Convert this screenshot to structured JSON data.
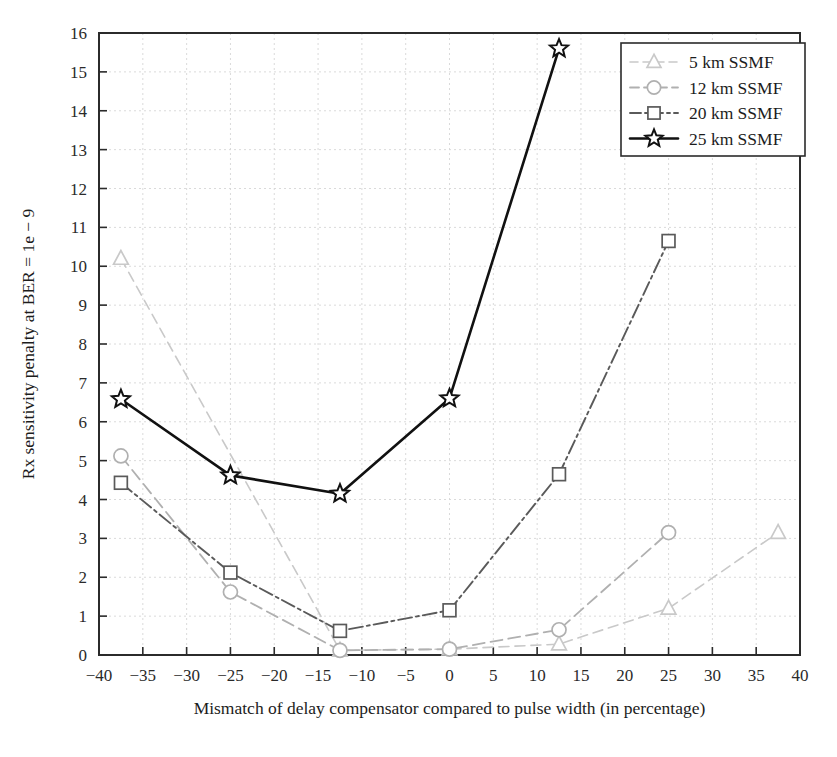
{
  "chart_data": {
    "type": "line",
    "title": "",
    "xlabel": "Mismatch of delay compensator compared to pulse width (in percentage)",
    "ylabel": "Rx sensitivity penalty at BER = 1e − 9",
    "xlim": [
      -40,
      40
    ],
    "ylim": [
      0,
      16
    ],
    "xticks": [
      -40,
      -35,
      -30,
      -25,
      -20,
      -15,
      -10,
      -5,
      0,
      5,
      10,
      15,
      20,
      25,
      30,
      35,
      40
    ],
    "yticks": [
      0,
      1,
      2,
      3,
      4,
      5,
      6,
      7,
      8,
      9,
      10,
      11,
      12,
      13,
      14,
      15,
      16
    ],
    "xtick_labels": [
      "−40",
      "−35",
      "−30",
      "−25",
      "−20",
      "−15",
      "−10",
      "−5",
      "0",
      "5",
      "10",
      "15",
      "20",
      "25",
      "30",
      "35",
      "40"
    ],
    "ytick_labels": [
      "0",
      "1",
      "2",
      "3",
      "4",
      "5",
      "6",
      "7",
      "8",
      "9",
      "10",
      "11",
      "12",
      "13",
      "14",
      "15",
      "16"
    ],
    "grid": true,
    "grid_style": "dashed",
    "legend_position": "top-right",
    "series": [
      {
        "name": "5 km SSMF",
        "marker": "triangle",
        "color": "#c9c9c9",
        "dash": "10,6",
        "width": 1.6,
        "x": [
          -37.5,
          -12.5,
          0,
          12.5,
          25,
          37.5
        ],
        "y": [
          10.2,
          0.12,
          0.15,
          0.28,
          1.2,
          3.15
        ]
      },
      {
        "name": "12 km SSMF",
        "marker": "circle",
        "color": "#b0b0b0",
        "dash": "12,6",
        "width": 1.8,
        "x": [
          -37.5,
          -25,
          -12.5,
          0,
          12.5,
          25
        ],
        "y": [
          5.12,
          1.62,
          0.12,
          0.15,
          0.65,
          3.15
        ]
      },
      {
        "name": "20 km SSMF",
        "marker": "square",
        "color": "#5a5a5a",
        "dash": "14,4,3,4",
        "width": 1.9,
        "x": [
          -37.5,
          -25,
          -12.5,
          0,
          12.5,
          25
        ],
        "y": [
          4.43,
          2.12,
          0.62,
          1.15,
          4.65,
          10.65
        ]
      },
      {
        "name": "25 km SSMF",
        "marker": "star",
        "color": "#111111",
        "dash": "0",
        "width": 2.6,
        "x": [
          -37.5,
          -25,
          -12.5,
          0,
          12.5
        ],
        "y": [
          6.58,
          4.62,
          4.15,
          6.6,
          15.6
        ]
      }
    ],
    "legend": [
      {
        "label": "5 km SSMF",
        "marker": "triangle",
        "color": "#c9c9c9",
        "dash": "8,5",
        "width": 1.6
      },
      {
        "label": "12 km SSMF",
        "marker": "circle",
        "color": "#b0b0b0",
        "dash": "9,5",
        "width": 1.8
      },
      {
        "label": "20 km SSMF",
        "marker": "square",
        "color": "#5a5a5a",
        "dash": "11,4,3,4",
        "width": 1.9
      },
      {
        "label": "25 km SSMF",
        "marker": "star",
        "color": "#111111",
        "dash": "0",
        "width": 2.6
      }
    ]
  }
}
